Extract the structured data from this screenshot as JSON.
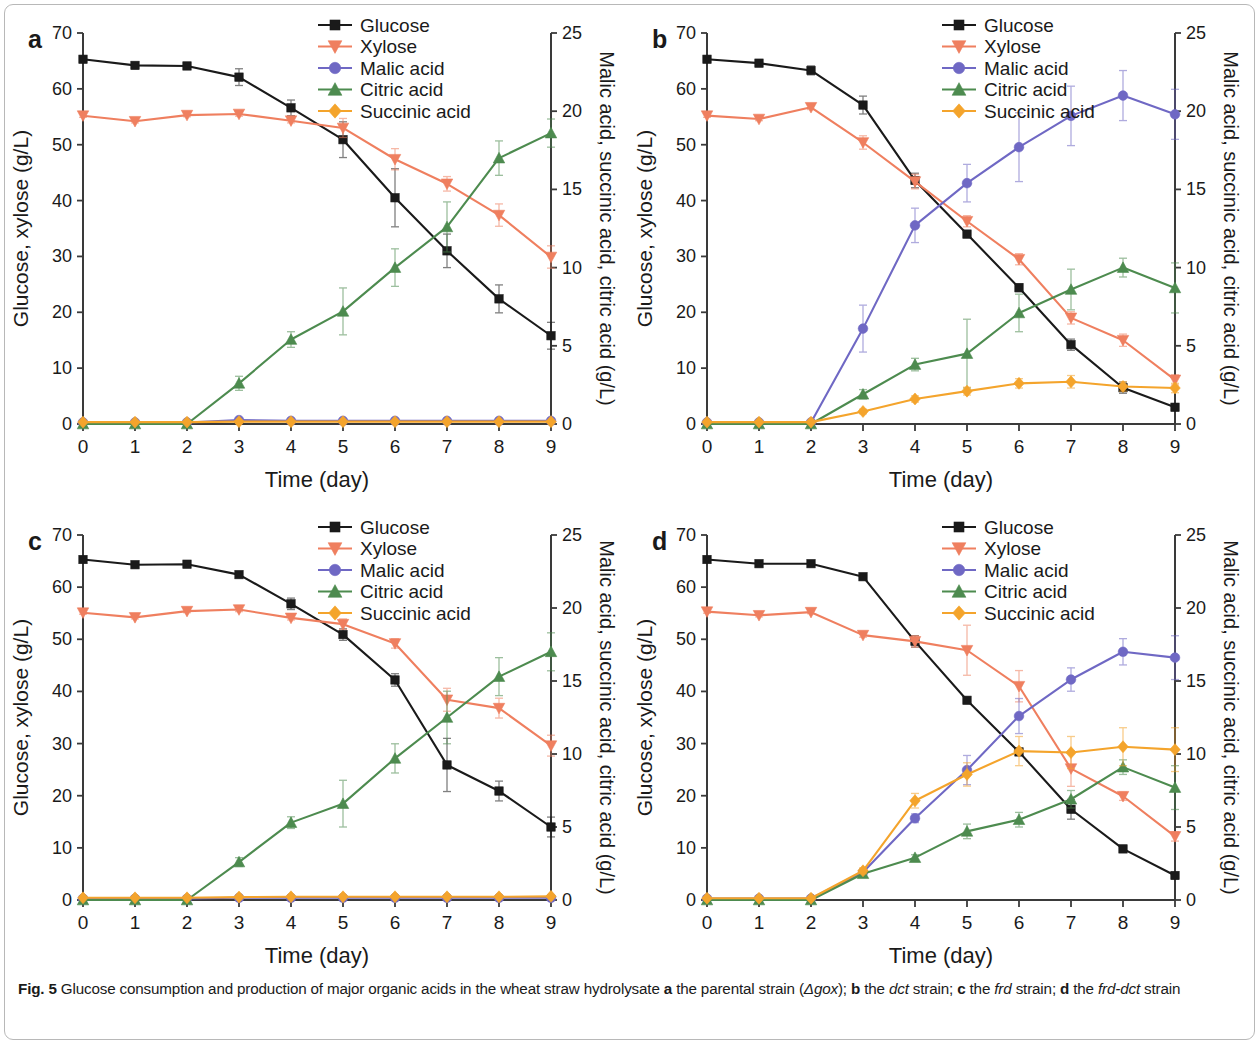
{
  "figure": {
    "label": "Fig. 5",
    "caption_parts": {
      "t1": " Glucose consumption and production of major organic acids in the wheat straw hydrolysate ",
      "a": "a",
      "t2": " the parental strain (",
      "gox": "Δgox",
      "t3": "); ",
      "b": "b",
      "t4": " the ",
      "dct": "dct",
      "t5": " strain; ",
      "c": "c",
      "t6": " the ",
      "frd": "frd",
      "t7": " strain; ",
      "d": "d",
      "t8": " the ",
      "frddct": "frd-dct",
      "t9": " strain"
    },
    "caption_full": "Fig. 5 Glucose consumption and production of major organic acids in the wheat straw hydrolysate a the parental strain (Δgox); b the dct strain; c the frd strain; d the frd-dct strain"
  },
  "colors": {
    "glucose": "#1a1a1a",
    "xylose": "#ef7f5f",
    "malic": "#6f68c4",
    "citric": "#4d8b4f",
    "succinic": "#f4a42c",
    "axis": "#3a3a3a",
    "error_bar": "#9a9a9a"
  },
  "legend": {
    "entries": [
      {
        "label": "Glucose",
        "series": "glucose",
        "marker": "square",
        "color": "#1a1a1a"
      },
      {
        "label": "Xylose",
        "series": "xylose",
        "marker": "triangle-down",
        "color": "#ef7f5f"
      },
      {
        "label": "Malic acid",
        "series": "malic",
        "marker": "circle",
        "color": "#6f68c4"
      },
      {
        "label": "Citric acid",
        "series": "citric",
        "marker": "triangle-up",
        "color": "#4d8b4f"
      },
      {
        "label": "Succinic acid",
        "series": "succinic",
        "marker": "diamond",
        "color": "#f4a42c"
      }
    ]
  },
  "axes_common": {
    "xlabel": "Time (day)",
    "ylabel_left": "Glucose, xylose (g/L)",
    "ylabel_right": "Malic acid, succinic acid, citric acid (g/L)",
    "x_ticks": [
      0,
      1,
      2,
      3,
      4,
      5,
      6,
      7,
      8,
      9
    ],
    "y_left_ticks": [
      0,
      10,
      20,
      30,
      40,
      50,
      60,
      70
    ],
    "y_right_ticks": [
      0,
      5,
      10,
      15,
      20,
      25
    ],
    "xlim": [
      0,
      9
    ],
    "ylim_left": [
      0,
      70
    ],
    "ylim_right": [
      0,
      25
    ],
    "grid": false,
    "legend_position": "top-center"
  },
  "chart_data": [
    {
      "type": "line",
      "panel": "a",
      "panel_label": "a",
      "title": "the parental strain (Δgox)",
      "xlabel": "Time (day)",
      "ylabel": "Glucose, xylose (g/L)",
      "ylabel_right": "Malic acid, succinic acid, citric acid (g/L)",
      "x": [
        0,
        1,
        2,
        3,
        4,
        5,
        6,
        7,
        8,
        9
      ],
      "xlim": [
        0,
        9
      ],
      "ylim": [
        0,
        70
      ],
      "ylim_right": [
        0,
        25
      ],
      "series": [
        {
          "name": "Glucose",
          "axis": "left",
          "values": [
            65.3,
            64.2,
            64.1,
            62.1,
            56.6,
            50.9,
            40.5,
            31.0,
            22.4,
            15.8
          ],
          "err": [
            0.4,
            0.4,
            0.4,
            1.5,
            1.4,
            3.2,
            5.2,
            3.0,
            2.5,
            2.4
          ]
        },
        {
          "name": "Xylose",
          "axis": "left",
          "values": [
            55.2,
            54.2,
            55.3,
            55.5,
            54.3,
            53.0,
            47.4,
            43.0,
            37.4,
            29.9
          ],
          "err": [
            0.3,
            0.3,
            0.3,
            0.4,
            0.4,
            1.7,
            1.9,
            1.3,
            2.0,
            2.0
          ]
        },
        {
          "name": "Malic acid",
          "axis": "right",
          "values": [
            0.1,
            0.1,
            0.1,
            0.25,
            0.2,
            0.2,
            0.2,
            0.2,
            0.2,
            0.2
          ],
          "err": [
            0.05,
            0.05,
            0.05,
            0.05,
            0.05,
            0.05,
            0.05,
            0.05,
            0.05,
            0.05
          ]
        },
        {
          "name": "Citric acid",
          "axis": "right",
          "values": [
            0.0,
            0.0,
            0.0,
            2.6,
            5.4,
            7.2,
            10.0,
            12.6,
            17.0,
            18.6
          ],
          "err": [
            0.0,
            0.0,
            0.0,
            0.45,
            0.5,
            1.5,
            1.2,
            1.6,
            1.1,
            0.9
          ]
        },
        {
          "name": "Succinic acid",
          "axis": "right",
          "values": [
            0.12,
            0.12,
            0.12,
            0.15,
            0.15,
            0.15,
            0.15,
            0.15,
            0.15,
            0.15
          ],
          "err": [
            0.04,
            0.04,
            0.04,
            0.04,
            0.04,
            0.04,
            0.04,
            0.04,
            0.04,
            0.04
          ]
        }
      ]
    },
    {
      "type": "line",
      "panel": "b",
      "panel_label": "b",
      "title": "the dct strain",
      "xlabel": "Time (day)",
      "ylabel": "Glucose, xylose (g/L)",
      "ylabel_right": "Malic acid, succinic acid, citric acid (g/L)",
      "x": [
        0,
        1,
        2,
        3,
        4,
        5,
        6,
        7,
        8,
        9
      ],
      "xlim": [
        0,
        9
      ],
      "ylim": [
        0,
        70
      ],
      "ylim_right": [
        0,
        25
      ],
      "series": [
        {
          "name": "Glucose",
          "axis": "left",
          "values": [
            65.3,
            64.6,
            63.3,
            57.1,
            43.6,
            34.0,
            24.4,
            14.2,
            6.5,
            3.0
          ],
          "err": [
            0.4,
            0.4,
            0.8,
            1.6,
            1.3,
            0.6,
            0.7,
            1.0,
            1.0,
            0.6
          ]
        },
        {
          "name": "Xylose",
          "axis": "left",
          "values": [
            55.2,
            54.6,
            56.7,
            50.4,
            43.4,
            36.3,
            29.5,
            19.0,
            15.0,
            7.9
          ],
          "err": [
            0.3,
            0.3,
            0.4,
            1.2,
            1.3,
            1.0,
            1.0,
            1.1,
            1.1,
            0.9
          ]
        },
        {
          "name": "Malic acid",
          "axis": "right",
          "values": [
            0.1,
            0.1,
            0.1,
            6.1,
            12.7,
            15.4,
            17.7,
            19.7,
            21.0,
            19.8
          ],
          "err": [
            0.05,
            0.05,
            0.05,
            1.5,
            1.1,
            1.2,
            2.2,
            1.9,
            1.6,
            1.6
          ]
        },
        {
          "name": "Citric acid",
          "axis": "right",
          "values": [
            0.0,
            0.0,
            0.0,
            1.9,
            3.8,
            4.5,
            7.1,
            8.6,
            10.0,
            8.7
          ],
          "err": [
            0.0,
            0.0,
            0.0,
            0.3,
            0.4,
            2.2,
            1.2,
            1.3,
            0.6,
            1.6
          ]
        },
        {
          "name": "Succinic acid",
          "axis": "right",
          "values": [
            0.12,
            0.12,
            0.12,
            0.8,
            1.6,
            2.1,
            2.6,
            2.7,
            2.4,
            2.3
          ],
          "err": [
            0.04,
            0.04,
            0.04,
            0.15,
            0.2,
            0.25,
            0.3,
            0.4,
            0.3,
            0.3
          ]
        }
      ]
    },
    {
      "type": "line",
      "panel": "c",
      "panel_label": "c",
      "title": "the frd strain",
      "xlabel": "Time (day)",
      "ylabel": "Glucose, xylose (g/L)",
      "ylabel_right": "Malic acid, succinic acid, citric acid (g/L)",
      "x": [
        0,
        1,
        2,
        3,
        4,
        5,
        6,
        7,
        8,
        9
      ],
      "xlim": [
        0,
        9
      ],
      "ylim": [
        0,
        70
      ],
      "ylim_right": [
        0,
        25
      ],
      "series": [
        {
          "name": "Glucose",
          "axis": "left",
          "values": [
            65.3,
            64.3,
            64.4,
            62.4,
            56.8,
            50.9,
            42.2,
            25.9,
            20.9,
            14.0
          ],
          "err": [
            0.4,
            0.4,
            0.4,
            0.5,
            1.1,
            1.1,
            1.2,
            5.1,
            1.9,
            1.9
          ]
        },
        {
          "name": "Xylose",
          "axis": "left",
          "values": [
            55.1,
            54.2,
            55.4,
            55.7,
            54.1,
            52.9,
            49.2,
            38.4,
            36.8,
            29.6
          ],
          "err": [
            0.3,
            0.3,
            0.3,
            0.4,
            0.4,
            1.0,
            0.9,
            2.2,
            1.9,
            2.0
          ]
        },
        {
          "name": "Malic acid",
          "axis": "right",
          "values": [
            0.1,
            0.1,
            0.1,
            0.15,
            0.15,
            0.15,
            0.15,
            0.15,
            0.15,
            0.15
          ],
          "err": [
            0.05,
            0.05,
            0.05,
            0.05,
            0.05,
            0.05,
            0.05,
            0.05,
            0.05,
            0.05
          ]
        },
        {
          "name": "Citric acid",
          "axis": "right",
          "values": [
            0.0,
            0.0,
            0.0,
            2.6,
            5.3,
            6.6,
            9.7,
            12.5,
            15.3,
            17.0
          ],
          "err": [
            0.0,
            0.0,
            0.0,
            0.3,
            0.4,
            1.6,
            1.0,
            1.8,
            1.3,
            1.3
          ]
        },
        {
          "name": "Succinic acid",
          "axis": "right",
          "values": [
            0.15,
            0.15,
            0.15,
            0.2,
            0.22,
            0.22,
            0.22,
            0.22,
            0.22,
            0.25
          ],
          "err": [
            0.04,
            0.04,
            0.04,
            0.04,
            0.04,
            0.04,
            0.04,
            0.04,
            0.04,
            0.04
          ]
        }
      ]
    },
    {
      "type": "line",
      "panel": "d",
      "panel_label": "d",
      "title": "the frd-dct strain",
      "xlabel": "Time (day)",
      "ylabel": "Glucose, xylose (g/L)",
      "ylabel_right": "Malic acid, succinic acid, citric acid (g/L)",
      "x": [
        0,
        1,
        2,
        3,
        4,
        5,
        6,
        7,
        8,
        9
      ],
      "xlim": [
        0,
        9
      ],
      "ylim": [
        0,
        70
      ],
      "ylim_right": [
        0,
        25
      ],
      "series": [
        {
          "name": "Glucose",
          "axis": "left",
          "values": [
            65.3,
            64.5,
            64.5,
            62.0,
            49.6,
            38.3,
            28.4,
            17.4,
            9.8,
            4.7
          ],
          "err": [
            0.4,
            0.4,
            0.4,
            0.4,
            1.1,
            0.5,
            0.6,
            1.9,
            0.5,
            0.5
          ]
        },
        {
          "name": "Xylose",
          "axis": "left",
          "values": [
            55.3,
            54.6,
            55.2,
            50.8,
            49.6,
            47.9,
            41.0,
            25.2,
            19.9,
            12.2
          ],
          "err": [
            0.3,
            0.3,
            0.3,
            0.4,
            1.1,
            4.8,
            3.0,
            3.4,
            0.8,
            0.9
          ]
        },
        {
          "name": "Malic acid",
          "axis": "right",
          "values": [
            0.1,
            0.1,
            0.1,
            1.9,
            5.6,
            8.9,
            12.6,
            15.1,
            17.0,
            16.6
          ],
          "err": [
            0.05,
            0.05,
            0.05,
            0.2,
            0.3,
            1.0,
            1.2,
            0.8,
            0.9,
            1.5
          ]
        },
        {
          "name": "Citric acid",
          "axis": "right",
          "values": [
            0.0,
            0.0,
            0.0,
            1.8,
            2.9,
            4.7,
            5.5,
            6.9,
            9.1,
            7.7
          ],
          "err": [
            0.0,
            0.0,
            0.0,
            0.15,
            0.2,
            0.5,
            0.5,
            0.6,
            0.5,
            1.5
          ]
        },
        {
          "name": "Succinic acid",
          "axis": "right",
          "values": [
            0.12,
            0.12,
            0.12,
            2.0,
            6.8,
            8.6,
            10.2,
            10.1,
            10.5,
            10.3
          ],
          "err": [
            0.04,
            0.04,
            0.04,
            0.2,
            0.5,
            0.8,
            1.0,
            1.1,
            1.3,
            1.5
          ]
        }
      ]
    }
  ]
}
